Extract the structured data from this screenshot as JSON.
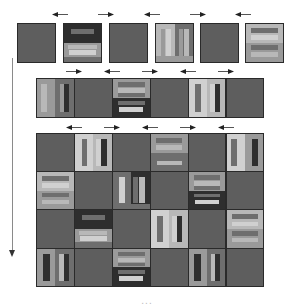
{
  "colors": {
    "plain": "#5e5e5e",
    "dark": "#2e2e2e",
    "mid": "#6e6e6e",
    "light": "#9a9a9a",
    "lighter": "#b8b8b8",
    "pale": "#d0d0d0",
    "border": "#2a2a2a"
  },
  "row1": {
    "arrows": [
      "left",
      "right",
      "left",
      "right",
      "left"
    ],
    "tiles": [
      "plain",
      "h-dark-top",
      "plain",
      "v-light",
      "plain",
      "h-light"
    ]
  },
  "row2": {
    "arrows": [
      "right",
      "left",
      "right",
      "left",
      "right"
    ],
    "tiles": [
      "v-mid",
      "plain",
      "h-dark-bottom",
      "plain",
      "v-pale",
      "plain"
    ]
  },
  "grid": {
    "arrows": [
      "left",
      "right",
      "left",
      "right",
      "left"
    ],
    "rows": [
      [
        "plain",
        "v-pale",
        "plain",
        "h-light-bottom",
        "plain",
        "v-pale-dark"
      ],
      [
        "h-light",
        "plain",
        "v-mid-dark",
        "plain",
        "h-dark-bottom",
        "plain"
      ],
      [
        "plain",
        "h-dark-top",
        "plain",
        "v-pale",
        "plain",
        "h-light"
      ],
      [
        "v-light-dark",
        "plain",
        "h-dark-bottom",
        "plain",
        "v-light-dark",
        "plain"
      ]
    ]
  },
  "caption": "...",
  "vertical_arrow": "down"
}
